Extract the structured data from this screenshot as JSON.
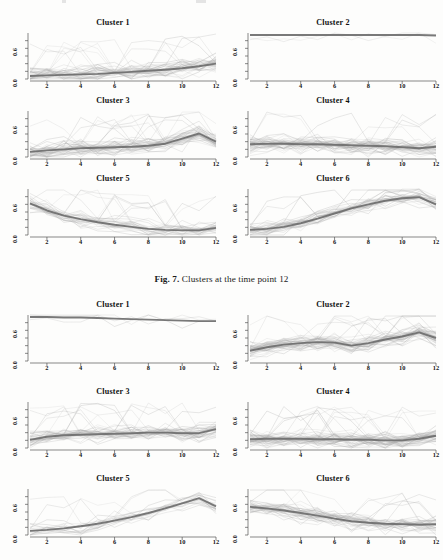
{
  "document": {
    "type": "scanned-journal-page",
    "caption": {
      "label": "Fig. 7.",
      "text": "Clusters at the time point 12"
    }
  },
  "axes": {
    "y_tick_labels": [
      "0.0",
      "0.6"
    ],
    "y_range": [
      0.0,
      0.9
    ],
    "x_tick_labels": [
      "2",
      "4",
      "6",
      "8",
      "10",
      "12"
    ],
    "x_range": [
      1,
      12
    ]
  },
  "colors": {
    "mean_curve": "#6e6e6e",
    "member_curve": "#a8a8a8",
    "axis": "#555555",
    "text": "#1a1a1a",
    "background": "#fdfdfc"
  },
  "figures": [
    {
      "id": "figure-7",
      "caption_label": "Fig. 7.",
      "caption_text": "Clusters at the time point 12",
      "panels": [
        {
          "title": "Cluster 1"
        },
        {
          "title": "Cluster 2"
        },
        {
          "title": "Cluster 3"
        },
        {
          "title": "Cluster 4"
        },
        {
          "title": "Cluster 5"
        },
        {
          "title": "Cluster 6"
        }
      ]
    },
    {
      "id": "figure-8-partial",
      "panels": [
        {
          "title": "Cluster 1"
        },
        {
          "title": "Cluster 2"
        },
        {
          "title": "Cluster 3"
        },
        {
          "title": "Cluster 4"
        },
        {
          "title": "Cluster 5"
        },
        {
          "title": "Cluster 6"
        }
      ]
    }
  ],
  "chart_data": [
    {
      "type": "line",
      "title": "Cluster 1",
      "figure": "Fig. 7.",
      "xlabel": "",
      "ylabel": "",
      "x": [
        1,
        2,
        3,
        4,
        5,
        6,
        7,
        8,
        9,
        10,
        11,
        12
      ],
      "xlim": [
        1,
        12
      ],
      "ylim": [
        0.0,
        0.9
      ],
      "grid": false,
      "legend": "none",
      "n_members": 34,
      "series": [
        {
          "name": "cluster mean",
          "values": [
            0.06,
            0.07,
            0.08,
            0.09,
            0.1,
            0.12,
            0.14,
            0.16,
            0.18,
            0.21,
            0.25,
            0.3
          ]
        }
      ]
    },
    {
      "type": "line",
      "title": "Cluster 2",
      "figure": "Fig. 7.",
      "x": [
        1,
        2,
        3,
        4,
        5,
        6,
        7,
        8,
        9,
        10,
        11,
        12
      ],
      "xlim": [
        1,
        12
      ],
      "ylim": [
        0.0,
        0.9
      ],
      "grid": false,
      "legend": "none",
      "n_members": 2,
      "series": [
        {
          "name": "cluster mean",
          "values": [
            0.86,
            0.86,
            0.86,
            0.86,
            0.86,
            0.86,
            0.86,
            0.86,
            0.86,
            0.86,
            0.86,
            0.85
          ]
        }
      ]
    },
    {
      "type": "line",
      "title": "Cluster 3",
      "figure": "Fig. 7.",
      "x": [
        1,
        2,
        3,
        4,
        5,
        6,
        7,
        8,
        9,
        10,
        11,
        12
      ],
      "xlim": [
        1,
        12
      ],
      "ylim": [
        0.0,
        0.9
      ],
      "grid": false,
      "legend": "none",
      "n_members": 40,
      "series": [
        {
          "name": "cluster mean",
          "values": [
            0.1,
            0.13,
            0.15,
            0.17,
            0.18,
            0.19,
            0.2,
            0.22,
            0.26,
            0.36,
            0.46,
            0.3
          ]
        }
      ]
    },
    {
      "type": "line",
      "title": "Cluster 4",
      "figure": "Fig. 7.",
      "x": [
        1,
        2,
        3,
        4,
        5,
        6,
        7,
        8,
        9,
        10,
        11,
        12
      ],
      "xlim": [
        1,
        12
      ],
      "ylim": [
        0.0,
        0.9
      ],
      "grid": false,
      "legend": "none",
      "n_members": 38,
      "series": [
        {
          "name": "cluster mean",
          "values": [
            0.25,
            0.26,
            0.26,
            0.25,
            0.25,
            0.24,
            0.23,
            0.22,
            0.21,
            0.19,
            0.17,
            0.2
          ]
        }
      ]
    },
    {
      "type": "line",
      "title": "Cluster 5",
      "figure": "Fig. 7.",
      "x": [
        1,
        2,
        3,
        4,
        5,
        6,
        7,
        8,
        9,
        10,
        11,
        12
      ],
      "xlim": [
        1,
        12
      ],
      "ylim": [
        0.0,
        0.9
      ],
      "grid": false,
      "legend": "none",
      "n_members": 28,
      "series": [
        {
          "name": "cluster mean",
          "values": [
            0.62,
            0.48,
            0.38,
            0.31,
            0.25,
            0.2,
            0.16,
            0.12,
            0.1,
            0.09,
            0.09,
            0.14
          ]
        }
      ]
    },
    {
      "type": "line",
      "title": "Cluster 6",
      "figure": "Fig. 7.",
      "x": [
        1,
        2,
        3,
        4,
        5,
        6,
        7,
        8,
        9,
        10,
        11,
        12
      ],
      "xlim": [
        1,
        12
      ],
      "ylim": [
        0.0,
        0.9
      ],
      "grid": false,
      "legend": "none",
      "n_members": 30,
      "series": [
        {
          "name": "cluster mean",
          "values": [
            0.1,
            0.12,
            0.16,
            0.23,
            0.32,
            0.42,
            0.52,
            0.6,
            0.67,
            0.72,
            0.74,
            0.6
          ]
        }
      ]
    },
    {
      "type": "line",
      "title": "Cluster 1",
      "figure": "figure-8-partial",
      "x": [
        1,
        2,
        3,
        4,
        5,
        6,
        7,
        8,
        9,
        10,
        11,
        12
      ],
      "xlim": [
        1,
        12
      ],
      "ylim": [
        0.0,
        0.9
      ],
      "grid": false,
      "legend": "none",
      "n_members": 3,
      "series": [
        {
          "name": "cluster mean",
          "values": [
            0.86,
            0.86,
            0.85,
            0.85,
            0.84,
            0.83,
            0.82,
            0.81,
            0.8,
            0.79,
            0.78,
            0.78
          ]
        }
      ]
    },
    {
      "type": "line",
      "title": "Cluster 2",
      "figure": "figure-8-partial",
      "x": [
        1,
        2,
        3,
        4,
        5,
        6,
        7,
        8,
        9,
        10,
        11,
        12
      ],
      "xlim": [
        1,
        12
      ],
      "ylim": [
        0.0,
        0.9
      ],
      "grid": false,
      "legend": "none",
      "n_members": 42,
      "series": [
        {
          "name": "cluster mean",
          "values": [
            0.2,
            0.27,
            0.32,
            0.35,
            0.37,
            0.36,
            0.3,
            0.35,
            0.42,
            0.48,
            0.56,
            0.45
          ]
        }
      ]
    },
    {
      "type": "line",
      "title": "Cluster 3",
      "figure": "figure-8-partial",
      "x": [
        1,
        2,
        3,
        4,
        5,
        6,
        7,
        8,
        9,
        10,
        11,
        12
      ],
      "xlim": [
        1,
        12
      ],
      "ylim": [
        0.0,
        0.9
      ],
      "grid": false,
      "legend": "none",
      "n_members": 36,
      "series": [
        {
          "name": "cluster mean",
          "values": [
            0.16,
            0.22,
            0.25,
            0.26,
            0.27,
            0.28,
            0.29,
            0.3,
            0.3,
            0.29,
            0.29,
            0.37
          ]
        }
      ]
    },
    {
      "type": "line",
      "title": "Cluster 4",
      "figure": "figure-8-partial",
      "x": [
        1,
        2,
        3,
        4,
        5,
        6,
        7,
        8,
        9,
        10,
        11,
        12
      ],
      "xlim": [
        1,
        12
      ],
      "ylim": [
        0.0,
        0.9
      ],
      "grid": false,
      "legend": "none",
      "n_members": 45,
      "series": [
        {
          "name": "cluster mean",
          "values": [
            0.17,
            0.18,
            0.18,
            0.18,
            0.17,
            0.17,
            0.16,
            0.16,
            0.15,
            0.15,
            0.18,
            0.24
          ]
        }
      ]
    },
    {
      "type": "line",
      "title": "Cluster 5",
      "figure": "figure-8-partial",
      "x": [
        1,
        2,
        3,
        4,
        5,
        6,
        7,
        8,
        9,
        10,
        11,
        12
      ],
      "xlim": [
        1,
        12
      ],
      "ylim": [
        0.0,
        0.9
      ],
      "grid": false,
      "legend": "none",
      "n_members": 18,
      "series": [
        {
          "name": "cluster mean",
          "values": [
            0.08,
            0.1,
            0.13,
            0.17,
            0.22,
            0.28,
            0.35,
            0.43,
            0.52,
            0.62,
            0.72,
            0.56
          ]
        }
      ]
    },
    {
      "type": "line",
      "title": "Cluster 6",
      "figure": "figure-8-partial",
      "x": [
        1,
        2,
        3,
        4,
        5,
        6,
        7,
        8,
        9,
        10,
        11,
        12
      ],
      "xlim": [
        1,
        12
      ],
      "ylim": [
        0.0,
        0.9
      ],
      "grid": false,
      "legend": "none",
      "n_members": 34,
      "series": [
        {
          "name": "cluster mean",
          "values": [
            0.55,
            0.52,
            0.48,
            0.43,
            0.38,
            0.32,
            0.27,
            0.24,
            0.22,
            0.21,
            0.2,
            0.21
          ]
        }
      ]
    }
  ]
}
